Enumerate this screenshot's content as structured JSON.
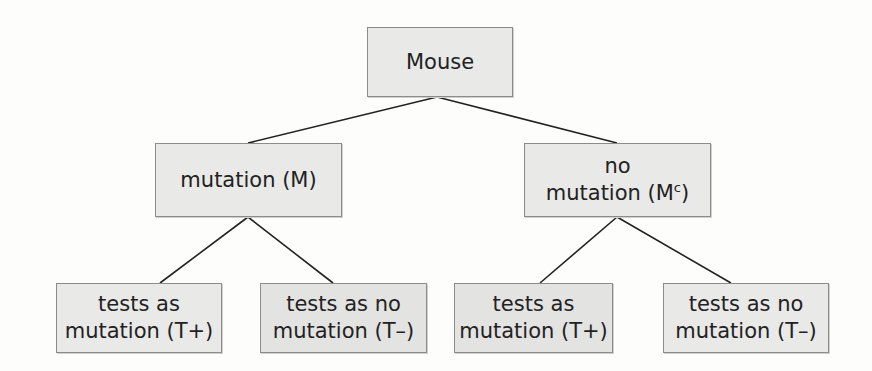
{
  "diagram": {
    "type": "tree",
    "colors": {
      "box_fill": "#e9e9e8",
      "box_border": "#8c8c8c",
      "line": "#222222",
      "text": "#222222"
    },
    "root": {
      "id": "mouse",
      "label": "Mouse"
    },
    "level1": [
      {
        "id": "mutation",
        "line1": "mutation (M)",
        "line2": ""
      },
      {
        "id": "no-mutation",
        "line1": "no",
        "line2": "mutation (M",
        "superscript": "c",
        "suffix": ")"
      }
    ],
    "level2": [
      {
        "id": "m-tplus",
        "parent": "mutation",
        "line1": "tests as",
        "line2": "mutation (T+)"
      },
      {
        "id": "m-tminus",
        "parent": "mutation",
        "line1": "tests as no",
        "line2": "mutation (T–)"
      },
      {
        "id": "mc-tplus",
        "parent": "no-mutation",
        "line1": "tests as",
        "line2": "mutation (T+)"
      },
      {
        "id": "mc-tminus",
        "parent": "no-mutation",
        "line1": "tests as no",
        "line2": "mutation (T–)"
      }
    ]
  }
}
